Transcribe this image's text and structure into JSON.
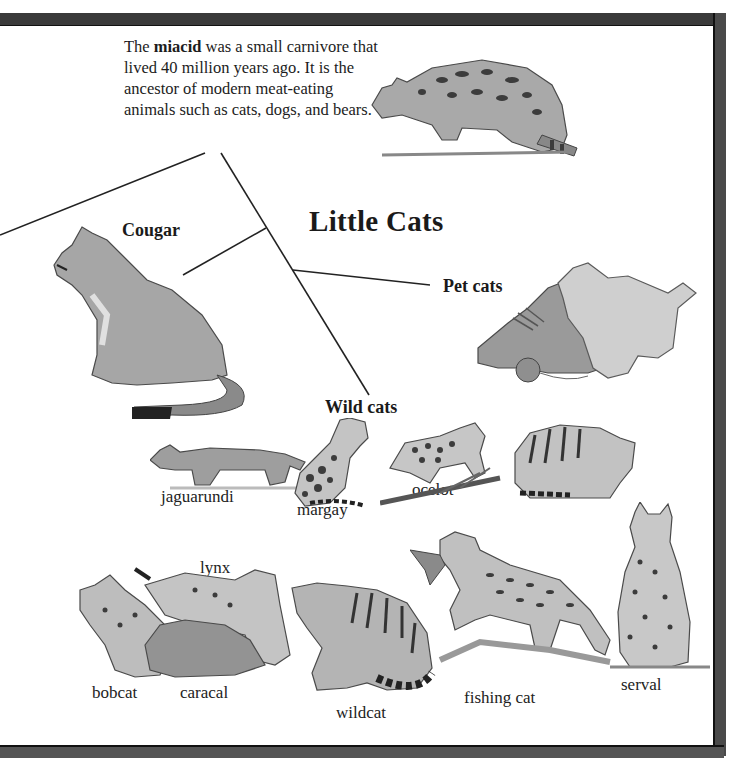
{
  "page": {
    "title": "Little Cats",
    "caption": {
      "prefix": "The ",
      "term": "miacid",
      "suffix": " was a small carnivore that lived 40 million years ago. It is the ancestor of modern meat-eating animals such as cats, dogs, and bears."
    },
    "branches": {
      "cougar": "Cougar",
      "pet_cats": "Pet cats",
      "wild_cats": "Wild cats"
    },
    "wild_cat_labels": {
      "jaguarundi": "jaguarundi",
      "margay": "margay",
      "ocelot": "ocelot",
      "manul": "manul",
      "lynx": "lynx",
      "bobcat": "bobcat",
      "caracal": "caracal",
      "wildcat": "wildcat",
      "fishing_cat": "fishing cat",
      "serval": "serval"
    },
    "colors": {
      "frame": "#3a3a3a",
      "text": "#1a1a1a",
      "line": "#222222",
      "illustration_fill": "#b8b8b8",
      "illustration_dark": "#555555"
    }
  }
}
